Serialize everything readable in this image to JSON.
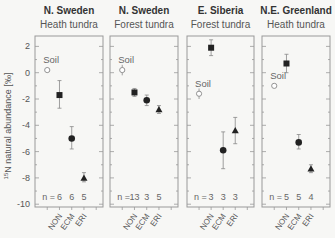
{
  "chart_data": {
    "type": "scatter",
    "ylabel": "15N natural abundance [‰]",
    "ylabel_parts": {
      "sup": "15",
      "main": "N natural abundance [‰]"
    },
    "ylim": [
      -10,
      2
    ],
    "yticks": [
      2,
      0,
      -2,
      -4,
      -6,
      -8,
      -10
    ],
    "categories": [
      "NON",
      "ECM",
      "ERI"
    ],
    "legend_annotation": "Soil",
    "n_prefix": "n =",
    "panels": [
      {
        "title": "N. Sweden",
        "subtitle": "Heath tundra",
        "soil": {
          "value": 0.2,
          "err": 0.2
        },
        "series": [
          {
            "name": "NON",
            "marker": "square",
            "value": -1.7,
            "low": -2.7,
            "high": -0.6,
            "n": 6
          },
          {
            "name": "ECM",
            "marker": "circle",
            "value": -5.0,
            "low": -5.8,
            "high": -4.1,
            "n": 6
          },
          {
            "name": "ERI",
            "marker": "triangle",
            "value": -8.0,
            "low": -8.3,
            "high": -7.6,
            "n": 5
          }
        ]
      },
      {
        "title": "N. Sweden",
        "subtitle": "Forest tundra",
        "soil": {
          "value": 0.2,
          "err": 0.4
        },
        "series": [
          {
            "name": "NON",
            "marker": "square",
            "value": -1.5,
            "low": -1.8,
            "high": -1.2,
            "n": 13
          },
          {
            "name": "ECM",
            "marker": "circle",
            "value": -2.1,
            "low": -2.5,
            "high": -1.7,
            "n": 3
          },
          {
            "name": "ERI",
            "marker": "triangle",
            "value": -2.8,
            "low": -3.1,
            "high": -2.5,
            "n": 5
          }
        ]
      },
      {
        "title": "E. Siberia",
        "subtitle": "Forest tundra",
        "soil": {
          "value": -1.6,
          "err": 0.4
        },
        "series": [
          {
            "name": "NON",
            "marker": "square",
            "value": 1.9,
            "low": 1.3,
            "high": 2.5,
            "n": 3
          },
          {
            "name": "ECM",
            "marker": "circle",
            "value": -5.9,
            "low": -7.3,
            "high": -4.5,
            "n": 3
          },
          {
            "name": "ERI",
            "marker": "triangle",
            "value": -4.4,
            "low": -5.4,
            "high": -3.4,
            "n": 3
          }
        ]
      },
      {
        "title": "N.E. Greenland",
        "subtitle": "Heath tundra",
        "soil": {
          "value": -1.0,
          "err": 0.15
        },
        "series": [
          {
            "name": "NON",
            "marker": "square",
            "value": 0.7,
            "low": 0.0,
            "high": 1.4,
            "n": 5
          },
          {
            "name": "ECM",
            "marker": "circle",
            "value": -5.3,
            "low": -5.8,
            "high": -4.7,
            "n": 5
          },
          {
            "name": "ERI",
            "marker": "triangle",
            "value": -7.3,
            "low": -7.6,
            "high": -7.0,
            "n": 4
          }
        ]
      }
    ],
    "grid": false,
    "legend_position": "none"
  },
  "colors": {
    "marker": "#222222",
    "frame": "#999999",
    "soil_marker": "#888888",
    "text": "#444444"
  }
}
